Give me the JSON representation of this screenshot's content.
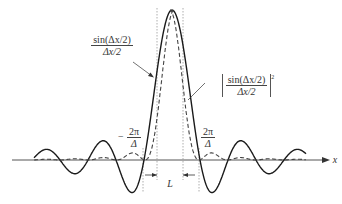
{
  "figure": {
    "axis_label": "x",
    "width_label": "L",
    "label_sinc": {
      "numerator": "sin(Δx/2)",
      "denominator": "Δx/2"
    },
    "label_sinc_squared": {
      "numerator": "sin(Δx/2)",
      "denominator": "Δx/2",
      "power": "2"
    },
    "label_left_zero": {
      "prefix": "−",
      "numerator": "2π",
      "denominator": "Δ"
    },
    "label_right_zero": {
      "numerator": "2π",
      "denominator": "Δ"
    },
    "caption": ""
  },
  "colors": {
    "curve": "#1a1a1a",
    "axis": "#555555",
    "dotted": "#888888"
  }
}
